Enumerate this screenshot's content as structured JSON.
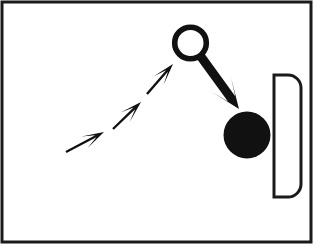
{
  "figure": {
    "kind": "schematic line drawing",
    "background_color": "#ffffff",
    "ink_color": "#111111",
    "frame": {
      "name": "outer-border",
      "x": 2,
      "y": 2,
      "width": 309,
      "height": 240,
      "stroke_width": 3,
      "stroke_color": "#1a1a1a",
      "fill": "none"
    },
    "canvas": {
      "width": 321,
      "height": 250
    }
  },
  "shapes": {
    "ring": {
      "label": "hollow-ring",
      "center_x": 190.5,
      "center_y": 43.0,
      "radius": 15.8,
      "stroke_width": 5.6,
      "stroke_color": "#111111",
      "fill": "none"
    },
    "target_dot": {
      "label": "filled-black-dot",
      "center_x": 247.0,
      "center_y": 135.0,
      "radius": 23.5,
      "fill_color": "#111111",
      "stroke": "none"
    },
    "d_shape": {
      "label": "d-shaped-outline",
      "x": 274,
      "y": 75,
      "width": 27,
      "height": 122,
      "corner_radius": 13,
      "stroke_width": 3,
      "stroke_color": "#1a1a1a",
      "fill": "#ffffff",
      "flat_side": "left"
    }
  },
  "arrows": {
    "approach": [
      {
        "label": "approach-arrow-1",
        "order": 1,
        "tail_x": 66,
        "tail_y": 152,
        "head_x": 104,
        "head_y": 132,
        "shaft_width": 2.4,
        "head_length": 22,
        "head_width": 13,
        "color": "#111111"
      },
      {
        "label": "approach-arrow-2",
        "order": 2,
        "tail_x": 113,
        "tail_y": 129,
        "head_x": 141,
        "head_y": 102,
        "shaft_width": 2.4,
        "head_length": 22,
        "head_width": 13,
        "color": "#111111"
      },
      {
        "label": "approach-arrow-3",
        "order": 3,
        "tail_x": 147,
        "tail_y": 94,
        "head_x": 173,
        "head_y": 64,
        "shaft_width": 2.4,
        "head_length": 22,
        "head_width": 13,
        "color": "#111111"
      }
    ],
    "exit": {
      "label": "exit-arrow-thick",
      "tail_x": 199,
      "tail_y": 54,
      "head_x": 239,
      "head_y": 109,
      "shaft_width": 9,
      "head_length": 30,
      "head_width": 24,
      "color": "#111111"
    }
  },
  "accessibility": {
    "alt_text": "Black and white schematic: three small arrows ascend from lower left toward a hollow circle, a thick arrow exits the circle downward to the right pointing at a large solid black dot, which sits beside a tall D shaped outline at the right edge."
  }
}
